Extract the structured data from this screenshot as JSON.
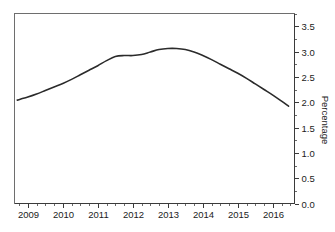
{
  "chart_data": {
    "type": "line",
    "title": "",
    "subtitle": "",
    "xlabel": "",
    "ylabel": "Percentage",
    "ylim": [
      0.0,
      3.75
    ],
    "xlim": [
      2008.62,
      2016.62
    ],
    "grid": false,
    "legend": null,
    "y_ticks": [
      "0.0",
      "0.5",
      "1.0",
      "1.5",
      "2.0",
      "2.5",
      "3.0",
      "3.5"
    ],
    "y_tick_values": [
      0.0,
      0.5,
      1.0,
      1.5,
      2.0,
      2.5,
      3.0,
      3.5
    ],
    "y_axis_position": "right",
    "x_ticks": [
      "2009",
      "2010",
      "2011",
      "2012",
      "2013",
      "2014",
      "2015",
      "2016"
    ],
    "x_tick_values": [
      2009,
      2010,
      2011,
      2012,
      2013,
      2014,
      2015,
      2016
    ],
    "x_minor_ticks_per_interval": 4,
    "line_color": "#2b2b2b",
    "frame_color": "#6e6e6e",
    "background_color": "#ffffff",
    "series": [
      {
        "name": "Percentage",
        "x": [
          2008.7,
          2009.0,
          2009.25,
          2009.5,
          2009.75,
          2010.0,
          2010.25,
          2010.5,
          2010.75,
          2011.0,
          2011.25,
          2011.5,
          2011.75,
          2012.0,
          2012.25,
          2012.5,
          2012.75,
          2013.0,
          2013.25,
          2013.5,
          2013.75,
          2014.0,
          2014.25,
          2014.5,
          2014.75,
          2015.0,
          2015.25,
          2015.5,
          2015.75,
          2016.0,
          2016.25,
          2016.45
        ],
        "values": [
          2.04,
          2.1,
          2.16,
          2.23,
          2.3,
          2.37,
          2.45,
          2.54,
          2.63,
          2.72,
          2.82,
          2.9,
          2.92,
          2.92,
          2.94,
          2.99,
          3.04,
          3.06,
          3.06,
          3.04,
          2.99,
          2.92,
          2.84,
          2.75,
          2.66,
          2.57,
          2.47,
          2.36,
          2.25,
          2.14,
          2.02,
          1.92
        ]
      }
    ],
    "annotations": []
  },
  "axis": {
    "y_title": "Percentage"
  }
}
